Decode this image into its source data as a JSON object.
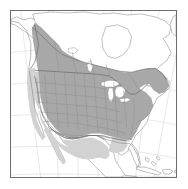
{
  "figure": {
    "kind": "range-map",
    "region": "North America",
    "caption": "",
    "frame": {
      "border_color": "#6d6d6d",
      "border_width_px": 1,
      "background": "#ffffff"
    }
  },
  "map": {
    "projection_hint": "conic",
    "ocean_color": "#ffffff",
    "land_unshaded_color": "#ffffff",
    "graticule_color": "#d8d8d8",
    "coastline_color": "#8a8a8a",
    "country_border_color": "#6a6a6a",
    "state_border_color": "#8f8f8f",
    "lake_color": "#ffffff",
    "legend_visible": false,
    "labels_visible": false
  },
  "range_layers": [
    {
      "name": "core-range",
      "description": "Dark shaded distribution covering western Canada, the northern plains and most of the contiguous United States",
      "fill_color": "#a8a8a8",
      "opacity": 1
    },
    {
      "name": "peripheral-range",
      "description": "Light shaded distribution covering the southwestern United States, Pacific coast and northern Mexico",
      "fill_color": "#d2d2d2",
      "opacity": 1
    }
  ],
  "features": {
    "countries": [
      "Canada",
      "United States",
      "Mexico",
      "Cuba",
      "Bahamas",
      "Hispaniola",
      "Puerto Rico"
    ],
    "water_bodies": [
      "Pacific Ocean",
      "Atlantic Ocean",
      "Gulf of Mexico",
      "Hudson Bay",
      "Great Lakes",
      "Great Slave Lake",
      "Lake Winnipeg"
    ],
    "subdivisions_shown": "US states and Canadian provinces"
  },
  "graticule": {
    "meridians_count": 7,
    "parallels_count": 6
  }
}
